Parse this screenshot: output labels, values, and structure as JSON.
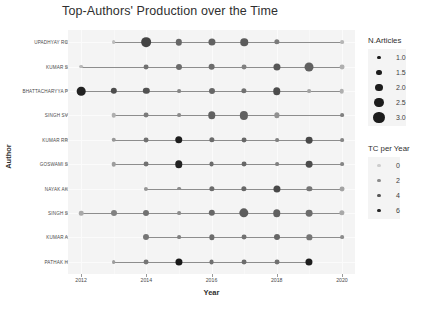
{
  "chart_data": {
    "type": "scatter",
    "title": "Top-Authors' Production over the Time",
    "xlabel": "Year",
    "ylabel": "Author",
    "xlim": [
      2011.6,
      2020.4
    ],
    "xticks": [
      "2012",
      "2014",
      "2016",
      "2018",
      "2020"
    ],
    "xtick_values": [
      2012,
      2014,
      2016,
      2018,
      2020
    ],
    "grid": true,
    "legend_position": "right",
    "categories": [
      "UPADHYAY RC",
      "KUMAR S",
      "BHATTACHARYYA P",
      "SINGH SV",
      "KUMAR RR",
      "GOSWAMI S",
      "NAYAK AK",
      "SINGH S",
      "KUMAR A",
      "PATHAK H"
    ],
    "series": [
      {
        "name": "UPADHYAY RC",
        "points": [
          {
            "year": 2013,
            "n_articles": 1.0,
            "tc_per_year": 0.4
          },
          {
            "year": 2014,
            "n_articles": 2.6,
            "tc_per_year": 4.8
          },
          {
            "year": 2015,
            "n_articles": 1.7,
            "tc_per_year": 3.4
          },
          {
            "year": 2016,
            "n_articles": 1.9,
            "tc_per_year": 3.6
          },
          {
            "year": 2017,
            "n_articles": 2.0,
            "tc_per_year": 3.8
          },
          {
            "year": 2018,
            "n_articles": 1.4,
            "tc_per_year": 2.6
          },
          {
            "year": 2020,
            "n_articles": 1.0,
            "tc_per_year": 0.6
          }
        ]
      },
      {
        "name": "KUMAR S",
        "points": [
          {
            "year": 2012,
            "n_articles": 1.0,
            "tc_per_year": 0.5
          },
          {
            "year": 2014,
            "n_articles": 1.3,
            "tc_per_year": 3.0
          },
          {
            "year": 2015,
            "n_articles": 1.6,
            "tc_per_year": 3.2
          },
          {
            "year": 2016,
            "n_articles": 1.8,
            "tc_per_year": 3.2
          },
          {
            "year": 2017,
            "n_articles": 1.3,
            "tc_per_year": 2.4
          },
          {
            "year": 2018,
            "n_articles": 1.9,
            "tc_per_year": 4.0
          },
          {
            "year": 2019,
            "n_articles": 2.4,
            "tc_per_year": 3.6
          },
          {
            "year": 2020,
            "n_articles": 1.3,
            "tc_per_year": 0.8
          }
        ]
      },
      {
        "name": "BHATTACHARYYA P",
        "points": [
          {
            "year": 2012,
            "n_articles": 2.3,
            "tc_per_year": 6.2
          },
          {
            "year": 2013,
            "n_articles": 1.7,
            "tc_per_year": 4.4
          },
          {
            "year": 2014,
            "n_articles": 1.7,
            "tc_per_year": 4.2
          },
          {
            "year": 2015,
            "n_articles": 1.0,
            "tc_per_year": 2.2
          },
          {
            "year": 2016,
            "n_articles": 1.6,
            "tc_per_year": 3.4
          },
          {
            "year": 2017,
            "n_articles": 1.4,
            "tc_per_year": 3.0
          },
          {
            "year": 2018,
            "n_articles": 2.0,
            "tc_per_year": 4.4
          },
          {
            "year": 2019,
            "n_articles": 1.0,
            "tc_per_year": 1.2
          },
          {
            "year": 2020,
            "n_articles": 1.2,
            "tc_per_year": 0.8
          }
        ]
      },
      {
        "name": "SINGH SV",
        "points": [
          {
            "year": 2013,
            "n_articles": 1.2,
            "tc_per_year": 0.8
          },
          {
            "year": 2014,
            "n_articles": 1.3,
            "tc_per_year": 2.6
          },
          {
            "year": 2015,
            "n_articles": 1.0,
            "tc_per_year": 2.0
          },
          {
            "year": 2016,
            "n_articles": 2.0,
            "tc_per_year": 3.6
          },
          {
            "year": 2017,
            "n_articles": 2.2,
            "tc_per_year": 3.6
          },
          {
            "year": 2018,
            "n_articles": 1.4,
            "tc_per_year": 1.8
          },
          {
            "year": 2020,
            "n_articles": 1.0,
            "tc_per_year": 2.4
          }
        ]
      },
      {
        "name": "KUMAR RR",
        "points": [
          {
            "year": 2013,
            "n_articles": 1.2,
            "tc_per_year": 1.6
          },
          {
            "year": 2014,
            "n_articles": 1.3,
            "tc_per_year": 3.0
          },
          {
            "year": 2015,
            "n_articles": 2.0,
            "tc_per_year": 6.4
          },
          {
            "year": 2016,
            "n_articles": 1.4,
            "tc_per_year": 3.2
          },
          {
            "year": 2017,
            "n_articles": 1.3,
            "tc_per_year": 3.4
          },
          {
            "year": 2018,
            "n_articles": 1.0,
            "tc_per_year": 2.4
          },
          {
            "year": 2019,
            "n_articles": 1.8,
            "tc_per_year": 4.6
          },
          {
            "year": 2020,
            "n_articles": 1.0,
            "tc_per_year": 2.2
          }
        ]
      },
      {
        "name": "GOSWAMI S",
        "points": [
          {
            "year": 2013,
            "n_articles": 1.2,
            "tc_per_year": 1.4
          },
          {
            "year": 2014,
            "n_articles": 1.3,
            "tc_per_year": 3.0
          },
          {
            "year": 2015,
            "n_articles": 2.0,
            "tc_per_year": 6.2
          },
          {
            "year": 2016,
            "n_articles": 1.3,
            "tc_per_year": 3.2
          },
          {
            "year": 2017,
            "n_articles": 1.3,
            "tc_per_year": 3.4
          },
          {
            "year": 2018,
            "n_articles": 1.0,
            "tc_per_year": 2.4
          },
          {
            "year": 2019,
            "n_articles": 1.8,
            "tc_per_year": 4.4
          },
          {
            "year": 2020,
            "n_articles": 1.0,
            "tc_per_year": 2.2
          }
        ]
      },
      {
        "name": "NAYAK AK",
        "points": [
          {
            "year": 2014,
            "n_articles": 1.1,
            "tc_per_year": 1.6
          },
          {
            "year": 2015,
            "n_articles": 1.0,
            "tc_per_year": 2.0
          },
          {
            "year": 2016,
            "n_articles": 1.4,
            "tc_per_year": 3.2
          },
          {
            "year": 2017,
            "n_articles": 1.4,
            "tc_per_year": 3.4
          },
          {
            "year": 2018,
            "n_articles": 1.9,
            "tc_per_year": 4.6
          },
          {
            "year": 2019,
            "n_articles": 1.4,
            "tc_per_year": 2.8
          },
          {
            "year": 2020,
            "n_articles": 1.3,
            "tc_per_year": 1.2
          }
        ]
      },
      {
        "name": "SINGH S",
        "points": [
          {
            "year": 2012,
            "n_articles": 1.2,
            "tc_per_year": 1.0
          },
          {
            "year": 2013,
            "n_articles": 1.6,
            "tc_per_year": 2.4
          },
          {
            "year": 2014,
            "n_articles": 1.6,
            "tc_per_year": 3.0
          },
          {
            "year": 2015,
            "n_articles": 1.0,
            "tc_per_year": 2.0
          },
          {
            "year": 2016,
            "n_articles": 1.7,
            "tc_per_year": 3.4
          },
          {
            "year": 2017,
            "n_articles": 2.5,
            "tc_per_year": 3.8
          },
          {
            "year": 2018,
            "n_articles": 2.0,
            "tc_per_year": 3.6
          },
          {
            "year": 2019,
            "n_articles": 1.8,
            "tc_per_year": 3.2
          },
          {
            "year": 2020,
            "n_articles": 1.4,
            "tc_per_year": 1.0
          }
        ]
      },
      {
        "name": "KUMAR A",
        "points": [
          {
            "year": 2014,
            "n_articles": 1.6,
            "tc_per_year": 2.8
          },
          {
            "year": 2015,
            "n_articles": 1.0,
            "tc_per_year": 2.4
          },
          {
            "year": 2016,
            "n_articles": 1.4,
            "tc_per_year": 3.2
          },
          {
            "year": 2017,
            "n_articles": 1.3,
            "tc_per_year": 3.0
          },
          {
            "year": 2018,
            "n_articles": 1.6,
            "tc_per_year": 3.4
          },
          {
            "year": 2019,
            "n_articles": 1.4,
            "tc_per_year": 2.8
          },
          {
            "year": 2020,
            "n_articles": 1.0,
            "tc_per_year": 2.0
          }
        ]
      },
      {
        "name": "PATHAK H",
        "points": [
          {
            "year": 2013,
            "n_articles": 1.0,
            "tc_per_year": 1.4
          },
          {
            "year": 2014,
            "n_articles": 1.3,
            "tc_per_year": 2.8
          },
          {
            "year": 2015,
            "n_articles": 1.9,
            "tc_per_year": 6.6
          },
          {
            "year": 2016,
            "n_articles": 1.3,
            "tc_per_year": 3.0
          },
          {
            "year": 2017,
            "n_articles": 1.3,
            "tc_per_year": 3.2
          },
          {
            "year": 2018,
            "n_articles": 1.3,
            "tc_per_year": 3.0
          },
          {
            "year": 2019,
            "n_articles": 1.9,
            "tc_per_year": 6.4
          }
        ]
      }
    ],
    "legends": [
      {
        "id": "n-articles",
        "title": "N.Articles",
        "labels": [
          "1.0",
          "1.5",
          "2.0",
          "2.5",
          "3.0"
        ],
        "values": [
          1.0,
          1.5,
          2.0,
          2.5,
          3.0
        ],
        "encodes": "size"
      },
      {
        "id": "tc-per-year",
        "title": "TC per Year",
        "labels": [
          "0",
          "2",
          "4",
          "6"
        ],
        "values": [
          0,
          2,
          4,
          6
        ],
        "encodes": "color"
      }
    ],
    "colors": {
      "panel_background": "#f4f4f4",
      "gridline": "#fbfbfb",
      "line": "#8d8d8d",
      "point_light": "#c8c8c8",
      "point_dark": "#1c1c1c",
      "text": "#3d3d3d"
    }
  }
}
